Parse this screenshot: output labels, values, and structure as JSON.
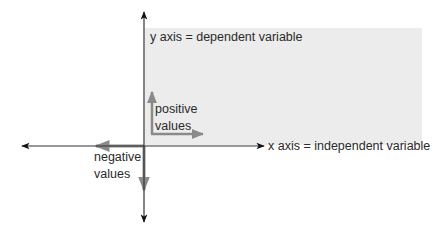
{
  "diagram": {
    "type": "coordinate-axes",
    "y_axis_label": "y axis = dependent variable",
    "x_axis_label": "x axis = independent variable",
    "positive_label_line1": "positive",
    "positive_label_line2": "values",
    "negative_label_line1": "negative",
    "negative_label_line2": "values",
    "colors": {
      "axis": "#333333",
      "value_arrows": "#8a8a8a",
      "shaded_quadrant": "#ececec",
      "text": "#2a2a2a"
    }
  }
}
